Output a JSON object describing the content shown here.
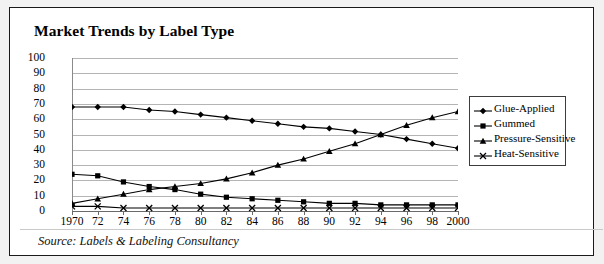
{
  "title": "Market Trends by Label Type",
  "source": "Source: Labels & Labeling Consultancy",
  "colors": {
    "frame": "#1a1a1a",
    "background": "#ffffff",
    "outer": "#f2f2f2",
    "grid": "#b4b4b4",
    "series": "#000000"
  },
  "legend": {
    "items": [
      {
        "label": "Glue-Applied",
        "marker": "diamond-marker"
      },
      {
        "label": "Gummed",
        "marker": "square-marker"
      },
      {
        "label": "Pressure-Sensitive",
        "marker": "triangle-marker"
      },
      {
        "label": "Heat-Sensitive",
        "marker": "cross-marker"
      }
    ]
  },
  "chart_data": {
    "type": "line",
    "title": "Market Trends by Label Type",
    "xlabel": "",
    "ylabel": "",
    "xlim": [
      1970,
      2000
    ],
    "ylim": [
      0,
      100
    ],
    "ytick_step": 10,
    "grid": true,
    "legend_position": "right",
    "annotation": "Source: Labels & Labeling Consultancy",
    "x": [
      1970,
      1972,
      1974,
      1976,
      1978,
      1980,
      1982,
      1984,
      1986,
      1988,
      1990,
      1992,
      1994,
      1996,
      1998,
      2000
    ],
    "xtick_labels": [
      "1970",
      "72",
      "74",
      "76",
      "78",
      "80",
      "82",
      "84",
      "86",
      "88",
      "90",
      "92",
      "94",
      "96",
      "98",
      "2000"
    ],
    "ytick_labels": [
      "0",
      "10",
      "20",
      "30",
      "40",
      "50",
      "60",
      "70",
      "80",
      "90",
      "100"
    ],
    "series": [
      {
        "name": "Glue-Applied",
        "marker": "diamond",
        "values": [
          68,
          68,
          68,
          66,
          65,
          63,
          61,
          59,
          57,
          55,
          54,
          52,
          50,
          47,
          44,
          41
        ]
      },
      {
        "name": "Gummed",
        "marker": "square",
        "values": [
          24,
          23,
          19,
          16,
          14,
          11,
          9,
          8,
          7,
          6,
          5,
          5,
          4,
          4,
          4,
          4
        ]
      },
      {
        "name": "Pressure-Sensitive",
        "marker": "triangle",
        "values": [
          5,
          8,
          11,
          14,
          16,
          18,
          21,
          25,
          30,
          34,
          39,
          44,
          50,
          56,
          61,
          65
        ]
      },
      {
        "name": "Heat-Sensitive",
        "marker": "cross",
        "values": [
          3,
          3,
          2,
          2,
          2,
          2,
          2,
          2,
          2,
          2,
          2,
          2,
          2,
          2,
          2,
          2
        ]
      }
    ]
  }
}
